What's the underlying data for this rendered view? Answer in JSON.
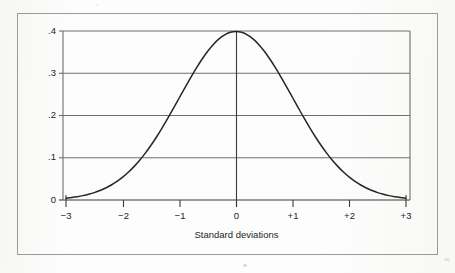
{
  "figure": {
    "background_color": "#fdfdfd",
    "frame_color": "#9a9a9a",
    "curve_color": "#262626",
    "gridline_color": "#6f6f6f",
    "axis_color": "#3a3a3a",
    "text_color": "#1d1d1d"
  },
  "chart_data": {
    "type": "line",
    "title": "",
    "subtitle": "",
    "xlabel": "Standard deviations",
    "ylabel": "",
    "xlim": [
      -3.3,
      3.3
    ],
    "ylim": [
      0,
      0.4
    ],
    "grid": true,
    "grid_axis": "y",
    "legend": false,
    "legend_position": "none",
    "x_ticks": [
      -3,
      -2,
      -1,
      0,
      1,
      2,
      3
    ],
    "x_tick_labels": [
      "−3",
      "−2",
      "−1",
      "0",
      "+1",
      "+2",
      "+3"
    ],
    "y_ticks": [
      0,
      0.1,
      0.2,
      0.3,
      0.4
    ],
    "y_tick_labels": [
      "0",
      ".1",
      ".2",
      ".3",
      ".4"
    ],
    "annotations": [
      {
        "name": "mean-vertical-line",
        "x": 0,
        "y_from": 0,
        "y_to": 0.3989
      }
    ],
    "series": [
      {
        "name": "Standard normal density",
        "formula": "phi(x) = (1/sqrt(2*pi)) * exp(-x^2/2)",
        "x": [
          -3.3,
          -3.2,
          -3.1,
          -3.0,
          -2.9,
          -2.8,
          -2.7,
          -2.6,
          -2.5,
          -2.4,
          -2.3,
          -2.2,
          -2.1,
          -2.0,
          -1.9,
          -1.8,
          -1.7,
          -1.6,
          -1.5,
          -1.4,
          -1.3,
          -1.2,
          -1.1,
          -1.0,
          -0.9,
          -0.8,
          -0.7,
          -0.6,
          -0.5,
          -0.4,
          -0.3,
          -0.2,
          -0.1,
          0.0,
          0.1,
          0.2,
          0.3,
          0.4,
          0.5,
          0.6,
          0.7,
          0.8,
          0.9,
          1.0,
          1.1,
          1.2,
          1.3,
          1.4,
          1.5,
          1.6,
          1.7,
          1.8,
          1.9,
          2.0,
          2.1,
          2.2,
          2.3,
          2.4,
          2.5,
          2.6,
          2.7,
          2.8,
          2.9,
          3.0,
          3.1,
          3.2,
          3.3
        ],
        "y": [
          0.0017,
          0.0024,
          0.0033,
          0.0044,
          0.006,
          0.0079,
          0.0104,
          0.0136,
          0.0175,
          0.0224,
          0.0283,
          0.0355,
          0.044,
          0.054,
          0.0656,
          0.079,
          0.094,
          0.1109,
          0.1295,
          0.1497,
          0.1714,
          0.1942,
          0.2179,
          0.242,
          0.2661,
          0.2897,
          0.3123,
          0.3332,
          0.3521,
          0.3683,
          0.3814,
          0.391,
          0.397,
          0.3989,
          0.397,
          0.391,
          0.3814,
          0.3683,
          0.3521,
          0.3332,
          0.3123,
          0.2897,
          0.2661,
          0.242,
          0.2179,
          0.1942,
          0.1714,
          0.1497,
          0.1295,
          0.1109,
          0.094,
          0.079,
          0.0656,
          0.054,
          0.044,
          0.0355,
          0.0283,
          0.0224,
          0.0175,
          0.0136,
          0.0104,
          0.0079,
          0.006,
          0.0044,
          0.0033,
          0.0024,
          0.0017
        ]
      }
    ],
    "peak": {
      "x": 0,
      "y": 0.3989
    }
  }
}
